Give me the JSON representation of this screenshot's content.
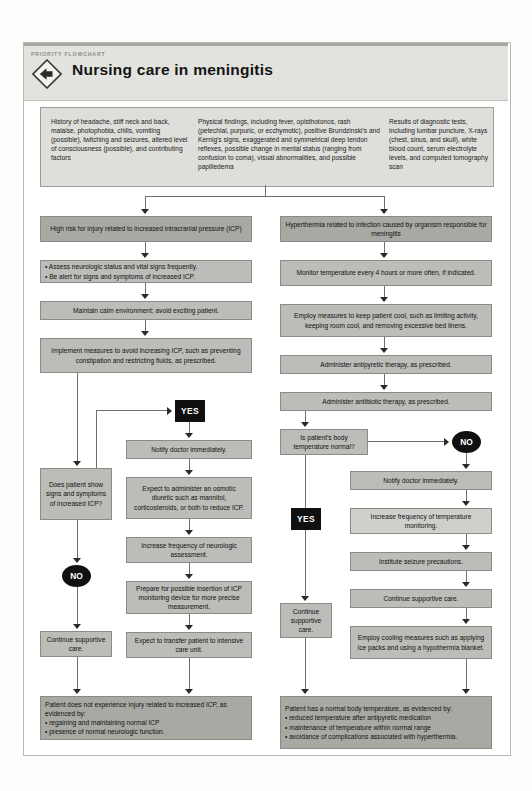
{
  "header": {
    "kicker": "PRIORITY FLOWCHART",
    "title": "Nursing care in meningitis",
    "icon": "diamond-left-arrow-icon"
  },
  "assessment": {
    "col1": "History of headache, stiff neck and back, malaise, photophobia, chills, vomiting (possible), twitching and seizures, altered level of consciousness (possible), and contributing factors",
    "col2": "Physical findings, including fever, opisthotonos, rash (petechial, purpuric, or ecchymotic), positive Brundzinski's and Kernig's signs, exaggerated and symmetrical deep tendon reflexes, possible change in mental status (ranging from confusion to coma), visual abnormalities, and possible papilledema",
    "col3": "Results of diagnostic tests, including lumbar puncture, X-rays (chest, sinus, and skull), white blood count, serum electrolyte levels, and computed tomography scan"
  },
  "left_branch": {
    "diagnosis": "High risk for injury related to increased intracranial pressure (ICP)",
    "interventions_bullets": [
      "Assess neurologic status and vital signs frequently.",
      "Be alert for signs and symptoms of increased ICP."
    ],
    "calm_environment": "Maintain calm environment; avoid exciting patient.",
    "implement_measures": "Implement measures to avoid increasing ICP, such as preventing constipation and restricting fluids, as prescribed.",
    "decision": "Does patient show signs and symptoms of increased ICP?",
    "yes_label": "YES",
    "no_label": "NO",
    "no_path": "Continue supportive care.",
    "yes_path": [
      "Notify doctor immediately.",
      "Expect to administer an osmotic diuretic such as mannitol, corticosteroids, or both to reduce ICP.",
      "Increase frequency of neurologic assessment.",
      "Prepare for possible insertion of ICP monitoring device for more precise measurement.",
      "Expect to transfer patient to intensive care unit."
    ],
    "outcome_intro": "Patient does not experience injury related to increased ICP, as evidenced by:",
    "outcome_bullets": [
      "regaining and maintaining normal ICP",
      "presence of normal neurologic function."
    ]
  },
  "right_branch": {
    "diagnosis": "Hyperthermia related to infection caused by organism responsible for meningitis",
    "monitor": "Monitor temperature every 4 hours or more often, if indicated.",
    "keep_cool": "Employ measures to keep patient cool, such as limiting activity, keeping room cool, and removing excessive bed linens.",
    "antipyretic": "Administer antipyretic therapy, as prescribed.",
    "antibiotic": "Administer antibiotic therapy, as prescribed.",
    "decision": "Is patient's body temperature normal?",
    "yes_label": "YES",
    "no_label": "NO",
    "yes_path": "Continue supportive care.",
    "no_path": [
      "Notify doctor immediately.",
      "Increase frequency of temperature monitoring.",
      "Institute seizure precautions.",
      "Continue supportive care.",
      "Employ cooling measures such as applying ice packs and using a hypothermia blanket."
    ],
    "outcome_intro": "Patient has a normal body temperature, as evidenced by:",
    "outcome_bullets": [
      "reduced temperature after antipyretic medication",
      "maintenance of temperature within normal range",
      "avoidance of complications associated with hyperthermia."
    ]
  },
  "colors": {
    "box_fill": "#bcbcb8",
    "box_light": "#cfcfcb",
    "box_dark": "#a9a9a4",
    "header_band": "#e2e2de",
    "badge": "#101010"
  }
}
